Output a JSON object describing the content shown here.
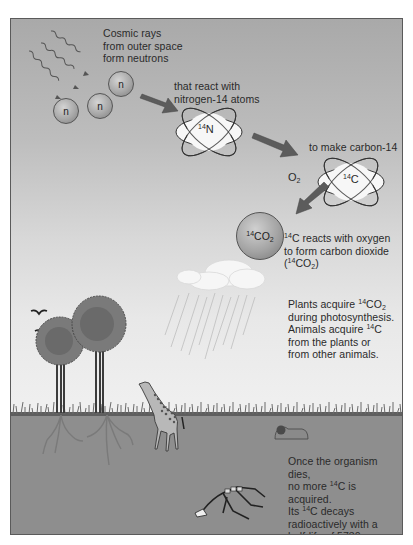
{
  "diagram": {
    "steps": {
      "cosmic_rays": {
        "line1": "Cosmic rays",
        "line2": "from outer space",
        "line3": "form neutrons"
      },
      "react": {
        "line1": "that react with",
        "line2": "nitrogen-14 atoms"
      },
      "make_c14": {
        "line1": "to make carbon-14"
      },
      "oxygen_label": {
        "base": "O",
        "sub": "2"
      },
      "co2_reaction": {
        "line1_sup": "14",
        "line1_rest": "C reacts with oxygen",
        "line2": "to form carbon dioxide",
        "line3_open": "(",
        "line3_sup": "14",
        "line3_base": "CO",
        "line3_sub": "2",
        "line3_close": ")"
      },
      "plants": {
        "line1_pre": "Plants acquire ",
        "line1_sup": "14",
        "line1_base": "CO",
        "line1_sub": "2",
        "line2": "during photosynthesis.",
        "line3_pre": "Animals acquire ",
        "line3_sup": "14",
        "line3_base": "C",
        "line4": "from the plants or",
        "line5": "from other animals."
      },
      "decay": {
        "line1": "Once the organism dies,",
        "line2_pre": "no more ",
        "line2_sup": "14",
        "line2_post": "C is acquired.",
        "line3_pre": "Its ",
        "line3_sup": "14",
        "line3_post": "C decays",
        "line4": "radioactively with a",
        "line5": "half-life of 5730 years."
      }
    },
    "particles": {
      "neutron_symbol": "n",
      "nitrogen": {
        "sup": "14",
        "symbol": "N"
      },
      "carbon": {
        "sup": "14",
        "symbol": "C"
      },
      "co2": {
        "sup": "14",
        "base": "CO",
        "sub": "2"
      }
    },
    "half_life_years": 5730,
    "colors": {
      "sky_top": "#a9a9a9",
      "sky_bottom": "#f0f0f0",
      "ground": "#8e8e8e",
      "arrow": "#5c5c5c",
      "tree_canopy": "#7a7a7a",
      "text": "#2a2a2a"
    }
  }
}
